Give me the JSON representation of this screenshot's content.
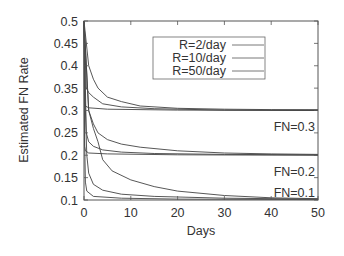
{
  "chart_data": {
    "type": "line",
    "title": "",
    "xlabel": "Days",
    "ylabel": "Estimated FN Rate",
    "xlim": [
      0,
      50
    ],
    "ylim": [
      0.1,
      0.5
    ],
    "xticks": [
      0,
      10,
      20,
      30,
      40,
      50
    ],
    "yticks": [
      0.1,
      0.15,
      0.2,
      0.25,
      0.3,
      0.35,
      0.4,
      0.45,
      0.5
    ],
    "grid": false,
    "legend_position": "upper right (inset)",
    "legend": [
      "R=2/day",
      "R=10/day",
      "R=50/day"
    ],
    "annotations": [
      {
        "text": "FN=0.3",
        "x": 47,
        "y": 0.31
      },
      {
        "text": "FN=0.2",
        "x": 47,
        "y": 0.21
      },
      {
        "text": "FN=0.1",
        "x": 47,
        "y": 0.11
      }
    ],
    "series": [
      {
        "name": "R=2/day (FN=0.3)",
        "x": [
          0,
          1,
          2,
          3,
          5,
          8,
          12,
          20,
          30,
          40,
          50
        ],
        "values": [
          0.5,
          0.4,
          0.37,
          0.35,
          0.33,
          0.32,
          0.31,
          0.305,
          0.303,
          0.302,
          0.302
        ]
      },
      {
        "name": "R=10/day (FN=0.3)",
        "x": [
          0,
          0.5,
          1,
          2,
          4,
          8,
          15,
          30,
          50
        ],
        "values": [
          0.5,
          0.35,
          0.34,
          0.33,
          0.315,
          0.308,
          0.304,
          0.301,
          0.3
        ]
      },
      {
        "name": "R=50/day (FN=0.3)",
        "x": [
          0,
          0.1,
          0.3,
          1,
          5,
          20,
          50
        ],
        "values": [
          0.5,
          0.32,
          0.31,
          0.306,
          0.303,
          0.301,
          0.3
        ]
      },
      {
        "name": "R=2/day (FN=0.2)",
        "x": [
          0,
          1,
          2,
          3,
          5,
          8,
          12,
          20,
          30,
          40,
          50
        ],
        "values": [
          0.5,
          0.3,
          0.27,
          0.25,
          0.235,
          0.225,
          0.218,
          0.21,
          0.205,
          0.203,
          0.202
        ]
      },
      {
        "name": "R=10/day (FN=0.2)",
        "x": [
          0,
          0.5,
          1,
          2,
          4,
          8,
          15,
          30,
          50
        ],
        "values": [
          0.5,
          0.25,
          0.23,
          0.22,
          0.212,
          0.207,
          0.204,
          0.202,
          0.201
        ]
      },
      {
        "name": "R=50/day (FN=0.2)",
        "x": [
          0,
          0.1,
          0.3,
          1,
          5,
          20,
          50
        ],
        "values": [
          0.5,
          0.22,
          0.21,
          0.205,
          0.203,
          0.201,
          0.2
        ]
      },
      {
        "name": "R=2/day (FN=0.1)",
        "x": [
          0,
          1,
          2,
          3,
          4,
          6,
          10,
          15,
          20,
          30,
          40,
          50
        ],
        "values": [
          0.5,
          0.3,
          0.26,
          0.23,
          0.19,
          0.165,
          0.145,
          0.13,
          0.12,
          0.11,
          0.105,
          0.103
        ]
      },
      {
        "name": "R=10/day (FN=0.1)",
        "x": [
          0,
          0.3,
          0.6,
          1,
          2,
          4,
          8,
          15,
          30,
          50
        ],
        "values": [
          0.5,
          0.3,
          0.2,
          0.16,
          0.135,
          0.122,
          0.113,
          0.108,
          0.104,
          0.102
        ]
      },
      {
        "name": "R=50/day (FN=0.1)",
        "x": [
          0,
          0.1,
          0.3,
          0.6,
          2,
          8,
          20,
          50
        ],
        "values": [
          0.5,
          0.25,
          0.14,
          0.12,
          0.108,
          0.104,
          0.102,
          0.101
        ]
      }
    ]
  }
}
